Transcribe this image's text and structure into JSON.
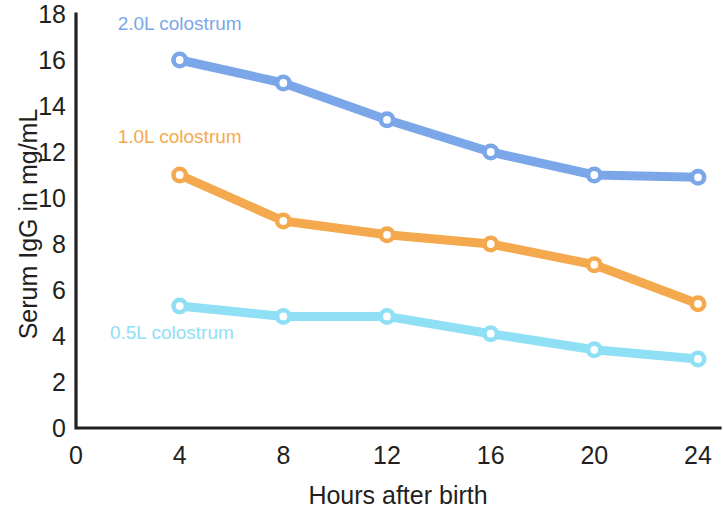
{
  "chart_data": {
    "type": "line",
    "title": "",
    "xlabel": "Hours after birth",
    "ylabel": "Serum IgG in mg/mL",
    "x": [
      4,
      8,
      12,
      16,
      20,
      24
    ],
    "xticks": [
      0,
      4,
      8,
      12,
      16,
      20,
      24
    ],
    "yticks": [
      0,
      2,
      4,
      6,
      8,
      10,
      12,
      14,
      16,
      18
    ],
    "xlim": [
      0,
      25.2
    ],
    "ylim": [
      0,
      18
    ],
    "grid": false,
    "legend_position": "inline-annotations",
    "series": [
      {
        "name": "2.0L colostrum",
        "color": "#7BA6E8",
        "values": [
          16.0,
          15.0,
          13.4,
          12.0,
          11.0,
          10.9
        ],
        "label_x": 4.0,
        "label_y": 17.3
      },
      {
        "name": "1.0L colostrum",
        "color": "#F5A94E",
        "values": [
          11.0,
          9.0,
          8.4,
          8.0,
          7.1,
          5.4
        ],
        "label_x": 4.0,
        "label_y": 12.4
      },
      {
        "name": "0.5L colostrum",
        "color": "#8FE0F5",
        "values": [
          5.3,
          4.85,
          4.85,
          4.1,
          3.4,
          3.0
        ],
        "label_x": 3.7,
        "label_y": 3.85
      }
    ]
  },
  "axis": {
    "x_tick_labels": [
      "0",
      "4",
      "8",
      "12",
      "16",
      "20",
      "24"
    ],
    "y_tick_labels": [
      "0",
      "2",
      "4",
      "6",
      "8",
      "10",
      "12",
      "14",
      "16",
      "18"
    ],
    "x_title": "Hours after birth",
    "y_title": "Serum IgG in mg/mL",
    "axis_color": "#231f20"
  }
}
